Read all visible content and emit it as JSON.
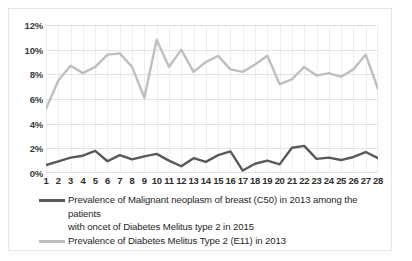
{
  "chart_data": {
    "type": "line",
    "title": "",
    "xlabel": "",
    "ylabel": "",
    "ylim": [
      0,
      12
    ],
    "ytick_labels": [
      "12%",
      "10%",
      "8%",
      "6%",
      "4%",
      "2%",
      "0%"
    ],
    "ytick_values": [
      12,
      10,
      8,
      6,
      4,
      2,
      0
    ],
    "grid": true,
    "legend_position": "bottom",
    "categories": [
      "1",
      "2",
      "3",
      "4",
      "5",
      "6",
      "7",
      "8",
      "9",
      "10",
      "11",
      "12",
      "13",
      "14",
      "15",
      "16",
      "17",
      "18",
      "19",
      "20",
      "21",
      "22",
      "23",
      "24",
      "25",
      "26",
      "27",
      "28"
    ],
    "series": [
      {
        "name": "Prevalence of Malignant neoplasm of breast (C50) in 2013 among the patients with oncet of Diabetes Melitus type 2 in 2015",
        "color": "#595959",
        "values": [
          0.65,
          0.95,
          1.25,
          1.4,
          1.8,
          0.95,
          1.45,
          1.1,
          1.35,
          1.55,
          1.0,
          0.55,
          1.2,
          0.9,
          1.45,
          1.75,
          0.2,
          0.75,
          1.0,
          0.7,
          2.05,
          2.2,
          1.15,
          1.25,
          1.05,
          1.3,
          1.7,
          1.2
        ]
      },
      {
        "name": "Prevalence of Diabetes Melitus Type 2 (E11) in 2013",
        "color": "#bfbfbf",
        "values": [
          5.2,
          7.5,
          8.7,
          8.1,
          8.6,
          9.6,
          9.7,
          8.6,
          6.1,
          10.8,
          8.6,
          10.0,
          8.2,
          9.0,
          9.5,
          8.4,
          8.2,
          8.8,
          9.5,
          7.2,
          7.6,
          8.6,
          7.9,
          8.1,
          7.8,
          8.4,
          9.6,
          6.8
        ]
      }
    ]
  },
  "legend": {
    "entry1_line1": "Prevalence of Malignant neoplasm of breast (C50) in 2013 among the patients",
    "entry1_line2": "with oncet of Diabetes Melitus type 2 in 2015",
    "entry2_line1": "Prevalence of Diabetes Melitus Type 2 (E11) in 2013"
  },
  "colors": {
    "series_dark": "#595959",
    "series_light": "#bfbfbf",
    "gridline": "#e2e2e2",
    "frame": "#e6e6e6",
    "background": "#ffffff"
  }
}
